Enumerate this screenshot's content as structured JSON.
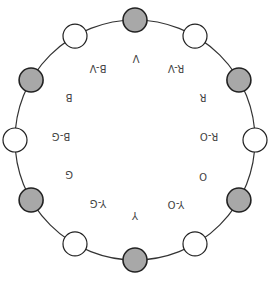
{
  "diagram": {
    "center": [
      135,
      140
    ],
    "radius": 120,
    "node_radius": 12,
    "colors": {
      "ring": "#333333",
      "node_stroke": "#222222",
      "primary_fill": "#a8a8a8",
      "secondary_fill": "#ffffff",
      "label": "#444444"
    },
    "nodes": [
      {
        "angle": 0,
        "fill": "primary"
      },
      {
        "angle": 30,
        "fill": "secondary"
      },
      {
        "angle": 60,
        "fill": "primary"
      },
      {
        "angle": 90,
        "fill": "secondary"
      },
      {
        "angle": 120,
        "fill": "primary"
      },
      {
        "angle": 150,
        "fill": "secondary"
      },
      {
        "angle": 180,
        "fill": "primary"
      },
      {
        "angle": 210,
        "fill": "secondary"
      },
      {
        "angle": 240,
        "fill": "primary"
      },
      {
        "angle": 270,
        "fill": "secondary"
      },
      {
        "angle": 300,
        "fill": "primary"
      },
      {
        "angle": 330,
        "fill": "secondary"
      }
    ],
    "labels": [
      {
        "text": "V",
        "x": 136,
        "y": 58
      },
      {
        "text": "R-V",
        "x": 176,
        "y": 68
      },
      {
        "text": "R",
        "x": 203,
        "y": 97
      },
      {
        "text": "R-O",
        "x": 209,
        "y": 136
      },
      {
        "text": "O",
        "x": 203,
        "y": 176
      },
      {
        "text": "Y-O",
        "x": 176,
        "y": 204
      },
      {
        "text": "Y",
        "x": 135,
        "y": 215
      },
      {
        "text": "Y-G",
        "x": 98,
        "y": 203
      },
      {
        "text": "G",
        "x": 69,
        "y": 174
      },
      {
        "text": "B-G",
        "x": 61,
        "y": 136
      },
      {
        "text": "B",
        "x": 69,
        "y": 97
      },
      {
        "text": "B-V",
        "x": 98,
        "y": 68
      }
    ]
  }
}
